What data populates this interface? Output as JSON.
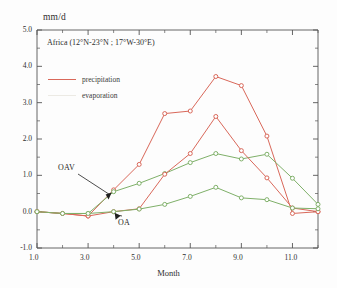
{
  "chart_data": {
    "type": "line",
    "title": "Africa (12°N-23°N ; 17°W-30°E)",
    "xlabel": "Month",
    "ylabel": "mm/d",
    "ylim": [
      -1.0,
      5.0
    ],
    "xlim": [
      1.0,
      12.0
    ],
    "grid": false,
    "legend_position": "upper-left-inside",
    "x": [
      1,
      2,
      3,
      4,
      5,
      6,
      7,
      8,
      9,
      10,
      11,
      12
    ],
    "xtick_labels": [
      "1.0",
      "3.0",
      "5.0",
      "7.0",
      "9.0",
      "11.0"
    ],
    "xtick_values": [
      1,
      3,
      5,
      7,
      9,
      11
    ],
    "ytick_labels": [
      "5.0",
      "4.0",
      "3.0",
      "2.0",
      "1.0",
      "0.0",
      "-1.0"
    ],
    "ytick_values": [
      5.0,
      4.0,
      3.0,
      2.0,
      1.0,
      0.0,
      -1.0
    ],
    "legend": [
      {
        "name": "precipitation",
        "color": "#d9685a"
      },
      {
        "name": "evaporation",
        "color": "#eceae4"
      }
    ],
    "annotations": [
      {
        "text": "OAV",
        "target_x": 4,
        "target_y": 0.58
      },
      {
        "text": "OA",
        "target_x": 4,
        "target_y": 0.0
      }
    ],
    "series": [
      {
        "name": "precipitation-oav",
        "color": "#d9685a",
        "marker": "open-circle",
        "values": [
          0.0,
          -0.05,
          -0.12,
          0.6,
          1.3,
          2.7,
          2.77,
          3.72,
          3.47,
          2.08,
          -0.05,
          0.0
        ]
      },
      {
        "name": "evaporation-oav",
        "color": "#7fb069",
        "marker": "open-circle",
        "values": [
          0.0,
          -0.05,
          -0.05,
          0.55,
          0.78,
          1.05,
          1.35,
          1.6,
          1.45,
          1.58,
          0.92,
          0.2
        ]
      },
      {
        "name": "precipitation-oa",
        "color": "#d9685a",
        "marker": "open-circle",
        "values": [
          0.0,
          -0.05,
          -0.12,
          0.0,
          0.08,
          1.03,
          1.6,
          2.62,
          1.68,
          0.93,
          0.1,
          0.0
        ]
      },
      {
        "name": "evaporation-oa",
        "color": "#7fb069",
        "marker": "open-circle",
        "values": [
          0.0,
          -0.05,
          -0.05,
          0.0,
          0.07,
          0.2,
          0.42,
          0.67,
          0.38,
          0.33,
          0.1,
          0.08
        ]
      }
    ]
  }
}
